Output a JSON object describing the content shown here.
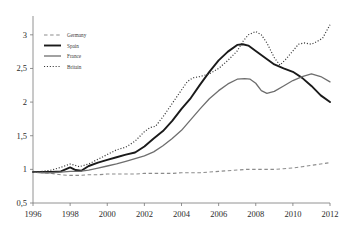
{
  "chart_data": {
    "type": "line",
    "title": "",
    "subtitle": "",
    "xlabel": "",
    "ylabel": "",
    "xlim": [
      1996,
      2012
    ],
    "ylim": [
      0.5,
      3.25
    ],
    "xticks": [
      "1996",
      "1998",
      "2000",
      "2002",
      "2004",
      "2006",
      "2008",
      "2010",
      "2012"
    ],
    "xtick_values": [
      1996,
      1998,
      2000,
      2002,
      2004,
      2006,
      2008,
      2010,
      2012
    ],
    "yticks": [
      "0,5",
      "1",
      "1,5",
      "2",
      "2,5",
      "3"
    ],
    "ytick_values": [
      0.5,
      1,
      1.5,
      2,
      2.5,
      3
    ],
    "grid": false,
    "legend_position": "top-left",
    "decimal_separator": ",",
    "series": [
      {
        "name": "Germany",
        "style": "dashed",
        "color": "#8c8c8c",
        "width": 1.1,
        "x": [
          1996,
          1996.5,
          1997,
          1997.5,
          1998,
          1998.5,
          1999,
          1999.5,
          2000,
          2000.5,
          2001,
          2001.5,
          2002,
          2002.5,
          2003,
          2003.5,
          2004,
          2004.5,
          2005,
          2005.5,
          2006,
          2006.5,
          2007,
          2007.5,
          2008,
          2008.5,
          2009,
          2009.5,
          2010,
          2010.5,
          2011,
          2011.5,
          2012
        ],
        "values": [
          0.97,
          0.95,
          0.94,
          0.92,
          0.91,
          0.91,
          0.92,
          0.92,
          0.93,
          0.93,
          0.93,
          0.93,
          0.94,
          0.94,
          0.94,
          0.94,
          0.95,
          0.95,
          0.95,
          0.96,
          0.97,
          0.98,
          0.99,
          1.0,
          1.0,
          1.0,
          1.0,
          1.01,
          1.02,
          1.04,
          1.06,
          1.08,
          1.1
        ]
      },
      {
        "name": "Spain",
        "style": "solid",
        "color": "#1a1a1a",
        "width": 1.9,
        "x": [
          1996,
          1996.5,
          1997,
          1997.5,
          1998,
          1998.3,
          1998.6,
          1999,
          1999.5,
          2000,
          2000.5,
          2001,
          2001.5,
          2002,
          2002.5,
          2003,
          2003.5,
          2004,
          2004.5,
          2005,
          2005.5,
          2006,
          2006.5,
          2007,
          2007.3,
          2007.6,
          2008,
          2008.5,
          2009,
          2009.5,
          2010,
          2010.5,
          2011,
          2011.5,
          2012
        ],
        "values": [
          0.96,
          0.96,
          0.96,
          0.97,
          1.03,
          0.99,
          0.98,
          1.05,
          1.1,
          1.14,
          1.18,
          1.22,
          1.25,
          1.34,
          1.46,
          1.57,
          1.72,
          1.9,
          2.06,
          2.26,
          2.45,
          2.62,
          2.75,
          2.85,
          2.86,
          2.84,
          2.76,
          2.66,
          2.56,
          2.5,
          2.45,
          2.36,
          2.24,
          2.1,
          2.0
        ]
      },
      {
        "name": "France",
        "style": "solid",
        "color": "#6e6e6e",
        "width": 1.3,
        "x": [
          1996,
          1996.5,
          1997,
          1997.5,
          1998,
          1998.5,
          1999,
          1999.5,
          2000,
          2000.5,
          2001,
          2001.5,
          2002,
          2002.5,
          2003,
          2003.5,
          2004,
          2004.5,
          2005,
          2005.5,
          2006,
          2006.5,
          2007,
          2007.4,
          2007.7,
          2008,
          2008.3,
          2008.6,
          2009,
          2009.5,
          2010,
          2010.5,
          2011,
          2011.5,
          2012
        ],
        "values": [
          0.96,
          0.95,
          0.95,
          0.96,
          0.97,
          0.97,
          0.99,
          1.02,
          1.05,
          1.08,
          1.12,
          1.16,
          1.2,
          1.26,
          1.35,
          1.46,
          1.58,
          1.74,
          1.9,
          2.05,
          2.17,
          2.27,
          2.34,
          2.35,
          2.34,
          2.28,
          2.17,
          2.13,
          2.16,
          2.24,
          2.32,
          2.38,
          2.42,
          2.38,
          2.3
        ]
      },
      {
        "name": "Britain",
        "style": "dotted",
        "color": "#3a3a3a",
        "width": 1.2,
        "x": [
          1996,
          1996.5,
          1997,
          1997.5,
          1998,
          1998.5,
          1999,
          1999.5,
          2000,
          2000.5,
          2001,
          2001.5,
          2002,
          2002.3,
          2002.6,
          2003,
          2003.5,
          2004,
          2004.3,
          2004.6,
          2005,
          2005.5,
          2006,
          2006.5,
          2007,
          2007.3,
          2007.6,
          2008,
          2008.3,
          2008.6,
          2009,
          2009.3,
          2009.6,
          2010,
          2010.3,
          2010.6,
          2011,
          2011.3,
          2011.6,
          2012
        ],
        "values": [
          0.96,
          0.97,
          0.99,
          1.03,
          1.08,
          1.04,
          1.08,
          1.15,
          1.22,
          1.29,
          1.33,
          1.42,
          1.56,
          1.62,
          1.64,
          1.78,
          1.98,
          2.18,
          2.3,
          2.36,
          2.38,
          2.42,
          2.5,
          2.62,
          2.76,
          2.9,
          3.0,
          3.05,
          3.0,
          2.88,
          2.66,
          2.55,
          2.63,
          2.76,
          2.86,
          2.88,
          2.86,
          2.9,
          2.95,
          3.15
        ]
      }
    ]
  },
  "legend": {
    "entries": [
      {
        "label": "Germany"
      },
      {
        "label": "Spain"
      },
      {
        "label": "France"
      },
      {
        "label": "Britain"
      }
    ]
  }
}
